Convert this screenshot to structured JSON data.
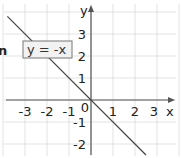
{
  "chart_data": {
    "type": "line",
    "title": "",
    "xlabel": "x",
    "ylabel": "y",
    "xlim": [
      -4,
      4
    ],
    "ylim": [
      -2.5,
      4.5
    ],
    "x_ticks": [
      -3,
      -2,
      -1,
      0,
      1,
      2,
      3
    ],
    "x_tick_labels": [
      "-3",
      "-2",
      "-1",
      "0",
      "1",
      "2",
      "3"
    ],
    "y_ticks": [
      3,
      2,
      1,
      -1,
      -2
    ],
    "y_tick_labels": [
      "3",
      "2",
      "1",
      "-1",
      "-2"
    ],
    "grid": true,
    "series": [
      {
        "name": "y = -x",
        "x": [
          -3.8,
          2.5
        ],
        "y": [
          3.8,
          -2.5
        ]
      }
    ],
    "annotations": [
      {
        "text": "y = -x",
        "boxed": true,
        "placement": "upper-left"
      }
    ],
    "cut_off_text": "n"
  }
}
